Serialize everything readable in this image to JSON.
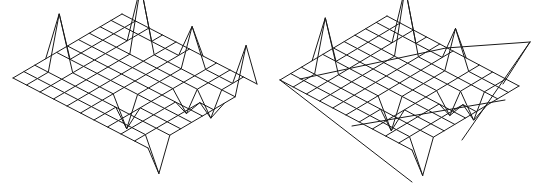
{
  "figure": {
    "width": 542,
    "height": 195,
    "background": "#ffffff",
    "line_color": "#1a1a1a"
  },
  "meshes": [
    {
      "name": "left-wireframe-surface",
      "n": 10,
      "origin": [
        13,
        78
      ],
      "u": [
        10.9,
        -6.4
      ],
      "v": [
        13.5,
        7.0
      ],
      "heights": [
        {
          "i": 1,
          "j": 0,
          "dz": 0
        },
        {
          "i": 3,
          "j": 1,
          "dz": -52
        },
        {
          "i": 10,
          "j": 0,
          "dz": 0
        },
        {
          "i": 8,
          "j": 3,
          "dz": -62
        },
        {
          "i": 3,
          "j": 6,
          "dz": 28
        },
        {
          "i": 9,
          "j": 6,
          "dz": -36
        },
        {
          "i": 7,
          "j": 9,
          "dz": 22
        },
        {
          "i": 0,
          "j": 10,
          "dz": 0
        },
        {
          "i": 2,
          "j": 10,
          "dz": 0
        },
        {
          "i": 9,
          "j": 10,
          "dz": -45
        },
        {
          "i": 1,
          "j": 10,
          "dz": 32
        },
        {
          "i": 6,
          "j": 8,
          "dz": 18
        }
      ],
      "extra_lines": []
    },
    {
      "name": "right-wireframe-surface",
      "n": 10,
      "origin": [
        280,
        80
      ],
      "u": [
        10.7,
        -6.4
      ],
      "v": [
        13.2,
        7.0
      ],
      "heights": [
        {
          "i": 3,
          "j": 1,
          "dz": -50
        },
        {
          "i": 8,
          "j": 3,
          "dz": -62
        },
        {
          "i": 3,
          "j": 6,
          "dz": 28
        },
        {
          "i": 9,
          "j": 6,
          "dz": -36
        },
        {
          "i": 7,
          "j": 9,
          "dz": 22
        },
        {
          "i": 1,
          "j": 10,
          "dz": 32
        },
        {
          "i": 6,
          "j": 8,
          "dz": 18
        }
      ],
      "extra_lines": [
        [
          [
            280,
            80
          ],
          [
            412,
            182
          ]
        ],
        [
          [
            530,
            42
          ],
          [
            462,
            140
          ]
        ],
        [
          [
            530,
            42
          ],
          [
            446,
            48
          ]
        ],
        [
          [
            530,
            42
          ],
          [
            503,
            84
          ]
        ],
        [
          [
            300,
            79
          ],
          [
            446,
            48
          ]
        ],
        [
          [
            352,
            126
          ],
          [
            505,
            100
          ]
        ]
      ]
    }
  ]
}
